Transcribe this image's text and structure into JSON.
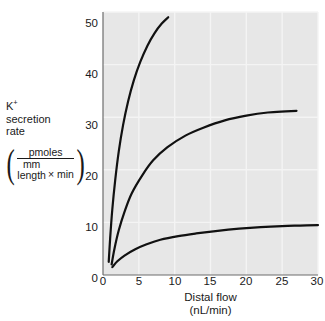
{
  "figure": {
    "background_color": "#ffffff",
    "plot_background_color": "#e7e7e7",
    "gridline_color": "#f4f4f4",
    "axis_color": "#6d6d6d",
    "curve_color": "#111111"
  },
  "yaxis": {
    "label_lines": [
      "K",
      "secretion",
      "rate"
    ],
    "label_superscript": "+",
    "units": {
      "numerator": "pmoles",
      "denominator_top": "mm",
      "denominator_bottom": "length",
      "denominator_factor": "× min"
    },
    "ticks": [
      "0",
      "10",
      "20",
      "30",
      "40",
      "50"
    ],
    "tick_values": [
      0,
      10,
      20,
      30,
      40,
      50
    ],
    "min": 0,
    "max": 50
  },
  "xaxis": {
    "title_line1": "Distal flow",
    "title_line2": "(nL/min)",
    "ticks": [
      "0",
      "5",
      "10",
      "15",
      "20",
      "25",
      "30"
    ],
    "tick_values": [
      0,
      5,
      10,
      15,
      20,
      25,
      30
    ],
    "min": 0,
    "max": 30
  },
  "annotations": [
    {
      "name": "high-k-diet-label",
      "prefix": "High K",
      "sup": "+",
      "suffix": " diet"
    },
    {
      "name": "normal-k-diet-label",
      "prefix": "Normal K",
      "sup": "+",
      "suffix": " diet"
    },
    {
      "name": "low-k-diet-label",
      "prefix": "Low K",
      "sup": "+",
      "suffix": " diet"
    }
  ],
  "chart_data": {
    "type": "line",
    "title": "",
    "xlabel": "Distal flow (nL/min)",
    "ylabel": "K+ secretion rate (pmoles / mm length × min)",
    "xlim": [
      0,
      30
    ],
    "ylim": [
      0,
      50
    ],
    "xticks": [
      0,
      5,
      10,
      15,
      20,
      25,
      30
    ],
    "yticks": [
      0,
      10,
      20,
      30,
      40,
      50
    ],
    "grid": true,
    "legend": "inline-annotations",
    "series": [
      {
        "name": "High K+ diet",
        "x": [
          0.8,
          1.0,
          1.3,
          1.7,
          2.2,
          2.8,
          3.5,
          4.3,
          5.2,
          6.2,
          7.2,
          8.2,
          9.1
        ],
        "y": [
          2.5,
          7.0,
          12.5,
          18.0,
          23.5,
          28.5,
          33.0,
          37.0,
          40.5,
          43.6,
          46.0,
          47.8,
          49.0
        ]
      },
      {
        "name": "Normal K+ diet",
        "x": [
          1.2,
          1.6,
          2.2,
          3.0,
          4.0,
          5.5,
          7.0,
          9.0,
          11.5,
          14.0,
          17.0,
          20.0,
          23.0,
          25.5,
          27.0
        ],
        "y": [
          2.0,
          5.0,
          8.5,
          12.0,
          15.5,
          19.0,
          21.8,
          24.3,
          26.5,
          28.0,
          29.4,
          30.3,
          30.9,
          31.1,
          31.2
        ]
      },
      {
        "name": "Low K+ diet",
        "x": [
          1.3,
          2.0,
          3.0,
          4.5,
          6.0,
          8.0,
          10.5,
          13.0,
          16.0,
          19.0,
          22.0,
          25.0,
          27.5,
          30.0
        ],
        "y": [
          1.5,
          2.6,
          3.7,
          4.9,
          5.8,
          6.7,
          7.4,
          7.9,
          8.4,
          8.8,
          9.1,
          9.3,
          9.4,
          9.5
        ]
      }
    ]
  }
}
